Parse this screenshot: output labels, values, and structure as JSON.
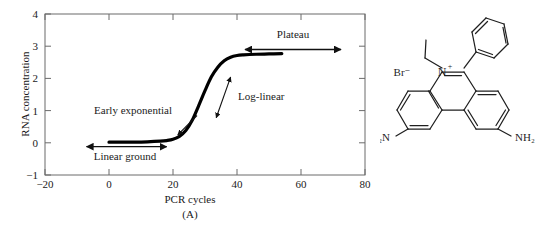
{
  "figure": {
    "panels": [
      {
        "id": "A",
        "caption": "(A)",
        "kind": "chart"
      },
      {
        "id": "B",
        "caption": "(B)",
        "kind": "chemical-structure"
      }
    ]
  },
  "chart_data": {
    "type": "line",
    "title": "",
    "xlabel": "PCR cycles",
    "ylabel": "RNA concentration",
    "xlim": [
      -20,
      80
    ],
    "ylim": [
      -1,
      4
    ],
    "xticks": [
      -20,
      0,
      20,
      40,
      60,
      80
    ],
    "xticklabels": [
      "−20",
      "0",
      "20",
      "40",
      "60",
      "80"
    ],
    "yticks": [
      -1,
      0,
      1,
      2,
      3,
      4
    ],
    "yticklabels": [
      "−1",
      "0",
      "1",
      "2",
      "3",
      "4"
    ],
    "grid": false,
    "legend": "none",
    "series": [
      {
        "name": "RNA concentration vs PCR cycles",
        "x": [
          0,
          4,
          8,
          12,
          16,
          18,
          20,
          22,
          24,
          26,
          28,
          30,
          32,
          34,
          36,
          38,
          40,
          42,
          46,
          50,
          54
        ],
        "y": [
          0.02,
          0.02,
          0.02,
          0.03,
          0.05,
          0.07,
          0.11,
          0.2,
          0.38,
          0.7,
          1.15,
          1.62,
          2.05,
          2.35,
          2.55,
          2.66,
          2.71,
          2.73,
          2.75,
          2.76,
          2.77
        ]
      }
    ],
    "annotations": [
      {
        "label": "Plateau",
        "type": "double-arrow",
        "arrow_x_range": [
          42,
          72
        ],
        "arrow_y": 2.9,
        "label_x": 57,
        "label_y": 3.28
      },
      {
        "label": "Log-linear",
        "type": "double-arrow",
        "arrow_from": [
          33.5,
          0.78
        ],
        "arrow_to": [
          38.0,
          2.05
        ],
        "label_x": 46,
        "label_y": 1.42
      },
      {
        "label": "Early exponential",
        "type": "single-arrow",
        "arrow_from": [
          27.5,
          0.85
        ],
        "arrow_to": [
          21.5,
          0.25
        ],
        "label_x": 12,
        "label_y": 0.88
      },
      {
        "label": "Linear ground",
        "type": "double-arrow",
        "arrow_x_range": [
          -7,
          18
        ],
        "arrow_y": -0.12,
        "label_x": 5,
        "label_y": -0.48
      }
    ]
  },
  "structure": {
    "name": "ethidium-bromide",
    "atom_labels": [
      {
        "key": "bromide",
        "text": "Br⁻"
      },
      {
        "key": "iminium-nitrogen",
        "text": "N"
      },
      {
        "key": "iminium-charge",
        "text": "+"
      },
      {
        "key": "amine-left",
        "text": "H₂N"
      },
      {
        "key": "amine-right",
        "text": "NH₂"
      }
    ]
  },
  "colors": {
    "ink": "#1a1a1a",
    "axis": "#5a5a5a",
    "curve": "#000000",
    "background": "#ffffff"
  }
}
